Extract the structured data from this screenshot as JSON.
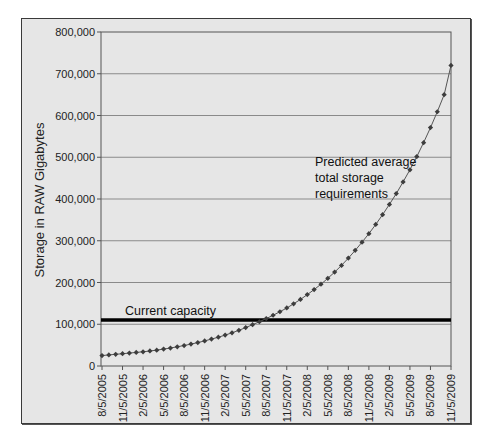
{
  "chart_data": {
    "type": "line",
    "title": "",
    "xlabel": "",
    "ylabel": "Storage in RAW Gigabytes",
    "ylim": [
      0,
      800000
    ],
    "y_ticks": [
      "0",
      "100,000",
      "200,000",
      "300,000",
      "400,000",
      "500,000",
      "600,000",
      "700,000",
      "800,000"
    ],
    "x_tick_labels": [
      "8/5/2005",
      "11/5/2005",
      "2/5/2006",
      "5/5/2006",
      "8/5/2006",
      "11/5/2006",
      "2/5/2007",
      "5/5/2007",
      "8/5/2007",
      "11/5/2007",
      "2/5/2008",
      "5/5/2008",
      "8/5/2008",
      "11/5/2008",
      "2/5/2009",
      "5/5/2009",
      "8/5/2009",
      "11/5/2009"
    ],
    "grid": true,
    "legend": "none",
    "series": [
      {
        "name": "Predicted average total storage requirements",
        "marker": "diamond",
        "color": "#444444",
        "start": "8/5/2005",
        "interval": "monthly",
        "values": [
          25000,
          26500,
          28000,
          29500,
          31000,
          32500,
          34000,
          36000,
          38000,
          40500,
          43000,
          46000,
          49000,
          52500,
          56000,
          60000,
          64500,
          69000,
          74000,
          79500,
          85500,
          92000,
          99000,
          106000,
          113500,
          121500,
          130000,
          139000,
          149000,
          159500,
          171000,
          183000,
          196000,
          210000,
          225000,
          241000,
          258500,
          277000,
          296500,
          317000,
          339000,
          362500,
          387000,
          413000,
          441000,
          470000,
          501500,
          535000,
          571000,
          609000,
          650000,
          720000
        ]
      },
      {
        "name": "Current capacity",
        "type": "hline",
        "color": "#000000",
        "value": 110000
      }
    ],
    "annotations": [
      {
        "text": "Current capacity",
        "near": "capacity line, left"
      },
      {
        "text": "Predicted average total storage requirements",
        "near": "curve, upper right"
      }
    ]
  },
  "labels": {
    "ylabel": "Storage in RAW Gigabytes",
    "capacity": "Current capacity",
    "predicted_line1": "Predicted average",
    "predicted_line2": "total storage",
    "predicted_line3": "requirements"
  }
}
